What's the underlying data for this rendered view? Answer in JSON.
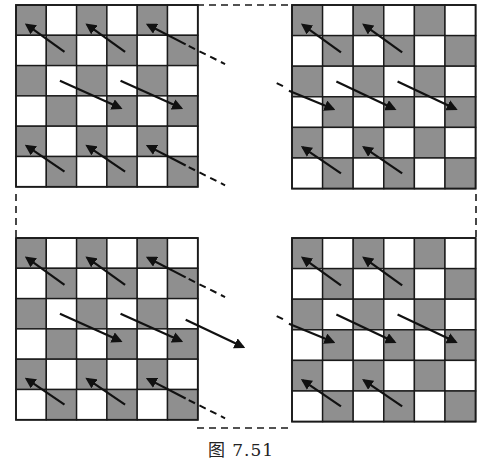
{
  "figure": {
    "caption": "图 7.51",
    "colors": {
      "dark_cell": "#8f8f8f",
      "light_cell": "#ffffff",
      "line": "#1a1a1a",
      "arrow": "#111111"
    },
    "grid_size": 6,
    "quadrants": [
      {
        "id": "top-left",
        "x": 16,
        "y": 5,
        "cell": 30.3,
        "first_dark_col_offset": 1,
        "arrows": [
          {
            "from": [
              1.6,
              1.55
            ],
            "to": [
              0.35,
              0.65
            ]
          },
          {
            "from": [
              3.6,
              1.55
            ],
            "to": [
              2.35,
              0.65
            ]
          },
          {
            "from": [
              5.6,
              1.3
            ],
            "to": [
              4.35,
              0.65
            ]
          },
          {
            "from": [
              1.45,
              2.5
            ],
            "to": [
              3.45,
              3.4
            ]
          },
          {
            "from": [
              3.45,
              2.5
            ],
            "to": [
              5.45,
              3.4
            ]
          },
          {
            "from": [
              1.6,
              5.5
            ],
            "to": [
              0.35,
              4.65
            ]
          },
          {
            "from": [
              3.6,
              5.5
            ],
            "to": [
              2.35,
              4.65
            ]
          },
          {
            "from": [
              5.6,
              5.3
            ],
            "to": [
              4.35,
              4.65
            ]
          }
        ],
        "dashes": [
          [
            5.7,
            1.35,
            6.9,
            1.95
          ],
          [
            -1,
            -1,
            -1,
            -1
          ],
          [
            5.7,
            5.35,
            6.9,
            5.95
          ]
        ]
      },
      {
        "id": "top-right",
        "x": 292,
        "y": 5,
        "cell": 30.6,
        "first_dark_col_offset": 1,
        "arrows": [
          {
            "from": [
              1.6,
              1.55
            ],
            "to": [
              0.35,
              0.65
            ]
          },
          {
            "from": [
              3.6,
              1.55
            ],
            "to": [
              2.35,
              0.65
            ]
          },
          {
            "from": [
              -0.1,
              2.8
            ],
            "to": [
              1.35,
              3.4
            ]
          },
          {
            "from": [
              1.45,
              2.5
            ],
            "to": [
              3.35,
              3.4
            ]
          },
          {
            "from": [
              3.45,
              2.5
            ],
            "to": [
              5.35,
              3.4
            ]
          },
          {
            "from": [
              1.6,
              5.5
            ],
            "to": [
              0.35,
              4.65
            ]
          },
          {
            "from": [
              3.6,
              5.5
            ],
            "to": [
              2.35,
              4.65
            ]
          }
        ],
        "dashes": [
          [
            -0.5,
            2.55,
            -0.2,
            2.7
          ]
        ]
      },
      {
        "id": "bottom-left",
        "x": 16,
        "y": 238,
        "cell": 30.3,
        "first_dark_col_offset": 1,
        "arrows": [
          {
            "from": [
              1.6,
              1.55
            ],
            "to": [
              0.35,
              0.65
            ]
          },
          {
            "from": [
              3.6,
              1.55
            ],
            "to": [
              2.35,
              0.65
            ]
          },
          {
            "from": [
              5.6,
              1.3
            ],
            "to": [
              4.35,
              0.65
            ]
          },
          {
            "from": [
              1.45,
              2.5
            ],
            "to": [
              3.45,
              3.4
            ]
          },
          {
            "from": [
              3.45,
              2.5
            ],
            "to": [
              5.45,
              3.4
            ]
          },
          {
            "from": [
              5.6,
              2.7
            ],
            "to": [
              7.5,
              3.6
            ]
          },
          {
            "from": [
              1.6,
              5.5
            ],
            "to": [
              0.35,
              4.65
            ]
          },
          {
            "from": [
              3.6,
              5.5
            ],
            "to": [
              2.35,
              4.65
            ]
          },
          {
            "from": [
              5.6,
              5.3
            ],
            "to": [
              4.35,
              4.65
            ]
          }
        ],
        "dashes": [
          [
            5.7,
            1.35,
            6.9,
            1.95
          ],
          [
            5.7,
            5.35,
            6.9,
            5.95
          ]
        ]
      },
      {
        "id": "bottom-right",
        "x": 292,
        "y": 238,
        "cell": 30.6,
        "first_dark_col_offset": 1,
        "arrows": [
          {
            "from": [
              1.6,
              1.55
            ],
            "to": [
              0.35,
              0.65
            ]
          },
          {
            "from": [
              3.6,
              1.55
            ],
            "to": [
              2.35,
              0.65
            ]
          },
          {
            "from": [
              -0.1,
              2.8
            ],
            "to": [
              1.35,
              3.4
            ]
          },
          {
            "from": [
              1.45,
              2.5
            ],
            "to": [
              3.35,
              3.4
            ]
          },
          {
            "from": [
              3.45,
              2.5
            ],
            "to": [
              5.35,
              3.4
            ]
          },
          {
            "from": [
              1.6,
              5.5
            ],
            "to": [
              0.35,
              4.65
            ]
          },
          {
            "from": [
              3.6,
              5.5
            ],
            "to": [
              2.35,
              4.65
            ]
          }
        ],
        "dashes": [
          [
            -0.5,
            2.55,
            -0.2,
            2.7
          ]
        ]
      }
    ],
    "connector_outline": {
      "x1": 16,
      "y1": 5,
      "x2": 476,
      "y2": 428
    }
  }
}
